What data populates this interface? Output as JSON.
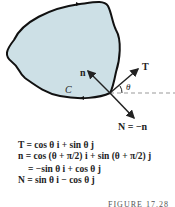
{
  "figure": {
    "region_fill": "#cde0e6",
    "curve_label": "C",
    "angle_label": "θ",
    "vectors": {
      "T": "T",
      "n": "n",
      "N_label": "N = −n"
    }
  },
  "equations": [
    "T = cos θ i + sin θ j",
    "n = cos (θ + π/2) i + sin (θ + π/2) j",
    "= −sin θ i + cos θ j",
    "N = sin θ i − cos θ j"
  ],
  "caption": "FIGURE 17.28"
}
